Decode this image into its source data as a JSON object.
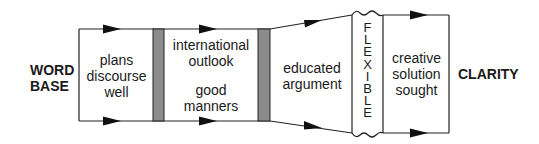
{
  "diagram": {
    "start_label": [
      "WORD",
      "BASE"
    ],
    "end_label": "CLARITY",
    "stages": [
      {
        "id": "plans",
        "lines": [
          "plans",
          "discourse",
          "well"
        ]
      },
      {
        "id": "international",
        "lines": [
          "international",
          "outlook"
        ],
        "lines2": [
          "good",
          "manners"
        ]
      },
      {
        "id": "educated",
        "lines": [
          "educated",
          "argument"
        ]
      },
      {
        "id": "flexible",
        "letters": [
          "F",
          "L",
          "E",
          "X",
          "I",
          "B",
          "L",
          "E"
        ]
      },
      {
        "id": "creative",
        "lines": [
          "creative",
          "solution",
          "sought"
        ]
      }
    ],
    "colors": {
      "line": "#222222",
      "separator_fill": "#8c8c8c",
      "background": "#ffffff"
    }
  }
}
